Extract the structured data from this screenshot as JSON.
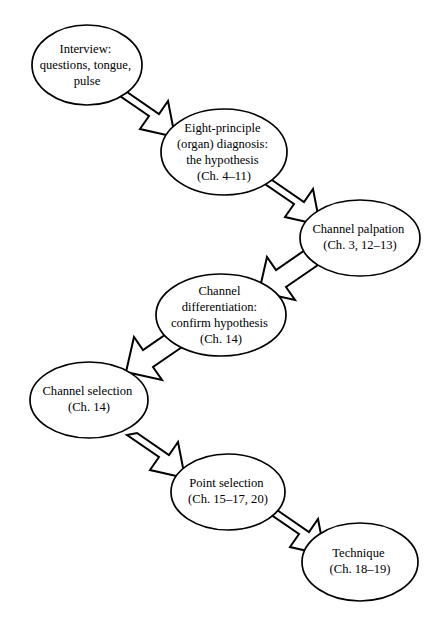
{
  "diagram": {
    "type": "flowchart",
    "background_color": "#ffffff",
    "stroke_color": "#000000",
    "node_fill_color": "#ffffff",
    "arrow_style": "open-outline-block-arrow",
    "nodes": [
      {
        "id": "interview",
        "lines": [
          "Interview:",
          "questions, tongue,",
          "pulse"
        ],
        "cx": 87,
        "cy": 65,
        "rx": 55,
        "ry": 40
      },
      {
        "id": "eight-principle",
        "lines": [
          "Eight-principle",
          "(organ) diagnosis:",
          "the hypothesis",
          "(Ch. 4–11)"
        ],
        "cx": 224,
        "cy": 152,
        "rx": 63,
        "ry": 43
      },
      {
        "id": "channel-palpation",
        "lines": [
          "Channel palpation",
          "(Ch. 3, 12–13)"
        ],
        "cx": 360,
        "cy": 238,
        "rx": 60,
        "ry": 38
      },
      {
        "id": "channel-differentiation",
        "lines": [
          "Channel",
          "differentiation:",
          "confirm hypothesis",
          "(Ch. 14)"
        ],
        "cx": 221,
        "cy": 315,
        "rx": 65,
        "ry": 41
      },
      {
        "id": "channel-selection",
        "lines": [
          "Channel selection",
          "(Ch. 14)"
        ],
        "cx": 89,
        "cy": 400,
        "rx": 59,
        "ry": 38
      },
      {
        "id": "point-selection",
        "lines": [
          "Point selection",
          "(Ch. 15–17, 20)"
        ],
        "cx": 228,
        "cy": 492,
        "rx": 57,
        "ry": 38
      },
      {
        "id": "technique",
        "lines": [
          "Technique",
          "(Ch. 18–19)"
        ],
        "cx": 360,
        "cy": 562,
        "rx": 58,
        "ry": 39
      },
      {
        "id": "interview-label",
        "label": "Interview: questions, tongue, pulse"
      }
    ],
    "edges": [
      {
        "id": "edge-interview-to-eight-principle",
        "from": "interview",
        "to": "eight-principle",
        "direction": "down-right"
      },
      {
        "id": "edge-eight-principle-to-channel-palpation",
        "from": "eight-principle",
        "to": "channel-palpation",
        "direction": "down-right"
      },
      {
        "id": "edge-channel-palpation-to-channel-differentiation",
        "from": "channel-palpation",
        "to": "channel-differentiation",
        "direction": "down-left"
      },
      {
        "id": "edge-channel-differentiation-to-channel-selection",
        "from": "channel-differentiation",
        "to": "channel-selection",
        "direction": "down-left"
      },
      {
        "id": "edge-channel-selection-to-point-selection",
        "from": "channel-selection",
        "to": "point-selection",
        "direction": "down-right"
      },
      {
        "id": "edge-point-selection-to-technique",
        "from": "point-selection",
        "to": "technique",
        "direction": "down-right"
      }
    ]
  }
}
